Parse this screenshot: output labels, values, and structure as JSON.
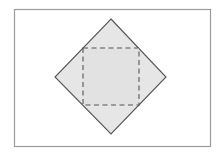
{
  "diagram": {
    "canvas": {
      "width": 220,
      "height": 156,
      "background": "#ffffff"
    },
    "frame": {
      "x": 14.5,
      "y": 9.5,
      "width": 196,
      "height": 137,
      "stroke": "#9a9a9a",
      "stroke_width": 1.2
    },
    "diamond": {
      "points": "111,19 166,77 111,134 55,77",
      "fill": "#e6e6e6",
      "stroke": "#555555",
      "stroke_width": 1.1
    },
    "dashed_square": {
      "x": 83,
      "y": 48,
      "width": 56,
      "height": 57,
      "fill": "#e2e2e2",
      "stroke": "#555555",
      "stroke_width": 1.1,
      "dasharray": "5,3.5"
    }
  }
}
